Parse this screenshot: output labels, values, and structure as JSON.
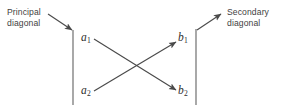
{
  "figure": {
    "background_color": "#ffffff",
    "stroke_color": "#4a4a4a",
    "text_color": "#3f3f3f",
    "math_text_color": "#2e2e2e",
    "annotations": {
      "principal_diagonal": "Principal\ndiagonal",
      "principal_diagonal_line1": "Principal",
      "principal_diagonal_line2": "diagonal",
      "secondary_diagonal": "Secondary\ndiagonal",
      "secondary_diagonal_line1": "Secondary",
      "secondary_diagonal_line2": "diagonal"
    },
    "terms": {
      "a1_base": "a",
      "a1_sub": "1",
      "a2_base": "a",
      "a2_sub": "2",
      "b1_base": "b",
      "b1_sub": "1",
      "b2_base": "b",
      "b2_sub": "2"
    },
    "bars": {
      "left_bar_x": 73,
      "left_bar_y1": 30,
      "left_bar_y2": 105,
      "right_bar_x": 196,
      "right_bar_y1": 29,
      "right_bar_y2": 105
    },
    "arrows": [
      {
        "name": "principal-diagonal-pointer",
        "from_x": 48,
        "from_y": 14,
        "to_x": 72,
        "to_y": 30
      },
      {
        "name": "secondary-diagonal-pointer",
        "from_x": 197,
        "from_y": 30,
        "to_x": 221,
        "to_y": 14
      },
      {
        "name": "a1-to-b2-arrow",
        "from_x": 94,
        "from_y": 39,
        "to_x": 176,
        "to_y": 90
      },
      {
        "name": "a2-to-b1-arrow",
        "from_x": 94,
        "from_y": 91,
        "to_x": 176,
        "to_y": 42
      }
    ]
  }
}
